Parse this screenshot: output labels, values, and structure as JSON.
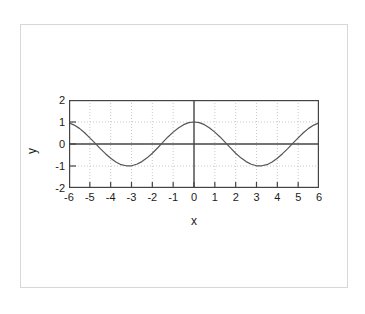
{
  "chart_data": {
    "type": "line",
    "title": "",
    "subtitle": "",
    "function": "y = cos(x)",
    "xlabel": "x",
    "ylabel": "y",
    "xlim": [
      -6,
      6
    ],
    "ylim": [
      -2,
      2
    ],
    "xticks": [
      "-6",
      "-5",
      "-4",
      "-3",
      "-2",
      "-1",
      "0",
      "1",
      "2",
      "3",
      "4",
      "5",
      "6"
    ],
    "xtick_values": [
      -6,
      -5,
      -4,
      -3,
      -2,
      -1,
      0,
      1,
      2,
      3,
      4,
      5,
      6
    ],
    "yticks": [
      "2",
      "1",
      "0",
      "-1",
      "-2"
    ],
    "ytick_values": [
      2,
      1,
      0,
      -1,
      -2
    ],
    "grid": true,
    "grid_style": "dotted",
    "legend": null,
    "legend_position": "none",
    "annotations": [],
    "series": [
      {
        "name": "cos(x)",
        "color": "#555555",
        "x": [
          -6.0,
          -5.75,
          -5.5,
          -5.25,
          -5.0,
          -4.75,
          -4.5,
          -4.25,
          -4.0,
          -3.75,
          -3.5,
          -3.25,
          -3.0,
          -2.75,
          -2.5,
          -2.25,
          -2.0,
          -1.75,
          -1.5,
          -1.25,
          -1.0,
          -0.75,
          -0.5,
          -0.25,
          0.0,
          0.25,
          0.5,
          0.75,
          1.0,
          1.25,
          1.5,
          1.75,
          2.0,
          2.25,
          2.5,
          2.75,
          3.0,
          3.25,
          3.5,
          3.75,
          4.0,
          4.25,
          4.5,
          4.75,
          5.0,
          5.25,
          5.5,
          5.75,
          6.0
        ],
        "values": [
          0.96,
          0.86,
          0.71,
          0.51,
          0.28,
          0.04,
          -0.21,
          -0.44,
          -0.65,
          -0.82,
          -0.94,
          -0.99,
          -0.99,
          -0.92,
          -0.8,
          -0.63,
          -0.42,
          -0.18,
          0.07,
          0.32,
          0.54,
          0.73,
          0.88,
          0.97,
          1.0,
          0.97,
          0.88,
          0.73,
          0.54,
          0.32,
          0.07,
          -0.18,
          -0.42,
          -0.63,
          -0.8,
          -0.92,
          -0.99,
          -0.99,
          -0.94,
          -0.82,
          -0.65,
          -0.44,
          -0.21,
          0.04,
          0.28,
          0.51,
          0.71,
          0.86,
          0.96
        ]
      }
    ]
  },
  "colors": {
    "curve": "#555555",
    "axis": "#444444",
    "frame": "#444444",
    "grid": "#bbbbbb",
    "card_border": "#d8d8d8",
    "text": "#1a1a1a",
    "background": "#ffffff"
  }
}
